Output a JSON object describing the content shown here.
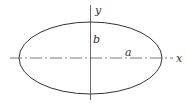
{
  "diagram": {
    "type": "ellipse",
    "labels": {
      "x_axis": "x",
      "y_axis": "y",
      "semi_major": "a",
      "semi_minor": "b"
    },
    "colors": {
      "stroke": "#333333",
      "background": "#ffffff"
    }
  }
}
